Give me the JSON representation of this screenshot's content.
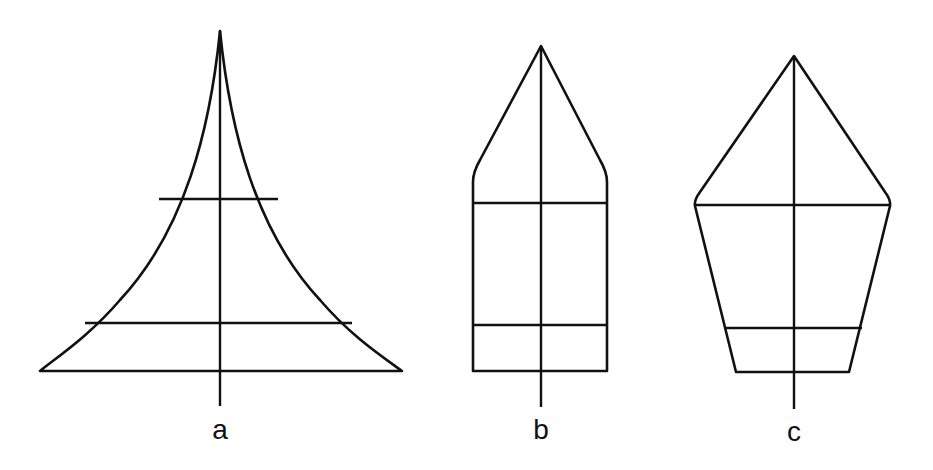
{
  "figure": {
    "background": "#ffffff",
    "stroke_color": "#111111",
    "panels": [
      {
        "id": "a",
        "label": "a",
        "shape": "concave-sided triangle (tapering spire)",
        "apex": [
          220,
          31
        ],
        "cross_lines": [
          {
            "y": 199,
            "x1": 159,
            "x2": 278
          },
          {
            "y": 323,
            "x1": 85,
            "x2": 352
          }
        ],
        "base": {
          "y": 371,
          "x1": 40,
          "x2": 402
        },
        "axis": {
          "x": 220,
          "y1": 31,
          "y2": 406
        },
        "label_pos": [
          220,
          419
        ]
      },
      {
        "id": "b",
        "label": "b",
        "shape": "rectangle with pointed roof (bullet)",
        "apex": [
          541,
          46
        ],
        "shoulders": {
          "y": 178,
          "x1": 473,
          "x2": 607
        },
        "cross_lines": [
          {
            "y": 203,
            "x1": 473,
            "x2": 607
          },
          {
            "y": 325,
            "x1": 473,
            "x2": 607
          }
        ],
        "base": {
          "y": 371,
          "x1": 473,
          "x2": 607
        },
        "axis": {
          "x": 541,
          "y1": 46,
          "y2": 407
        },
        "label_pos": [
          541,
          420
        ]
      },
      {
        "id": "c",
        "label": "c",
        "shape": "pentagon (kite over tapered trapezoid)",
        "apex": [
          794,
          56
        ],
        "cross_lines": [
          {
            "y": 205,
            "x1": 695,
            "x2": 890
          },
          {
            "y": 328,
            "x1": 725,
            "x2": 862
          }
        ],
        "base": {
          "y": 372,
          "x1": 736,
          "x2": 849
        },
        "axis": {
          "x": 794,
          "y1": 56,
          "y2": 409
        },
        "label_pos": [
          794,
          421
        ]
      }
    ]
  }
}
